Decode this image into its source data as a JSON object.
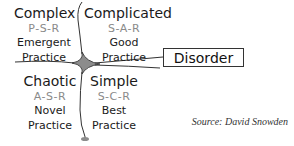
{
  "diagram": {
    "quadrants": [
      {
        "name": "Complex",
        "code": "P-S-R",
        "practice_line1": "Emergent",
        "practice_line2": "Practice",
        "position": "top-left"
      },
      {
        "name": "Complicated",
        "code": "S-A-R",
        "practice_line1": "Good",
        "practice_line2": "Practice",
        "position": "top-right"
      },
      {
        "name": "Chaotic",
        "code": "A-S-R",
        "practice_line1": "Novel",
        "practice_line2": "Practice",
        "position": "bottom-left"
      },
      {
        "name": "Simple",
        "code": "S-C-R",
        "practice_line1": "Best",
        "practice_line2": "Practice",
        "position": "bottom-right"
      }
    ],
    "center_label": "Disorder",
    "source": "Source: David Snowden"
  },
  "colors": {
    "line": "#333333",
    "center_fill": "#8c8c8c",
    "code_text": "#8a8a8a",
    "text": "#1a1a1a"
  }
}
